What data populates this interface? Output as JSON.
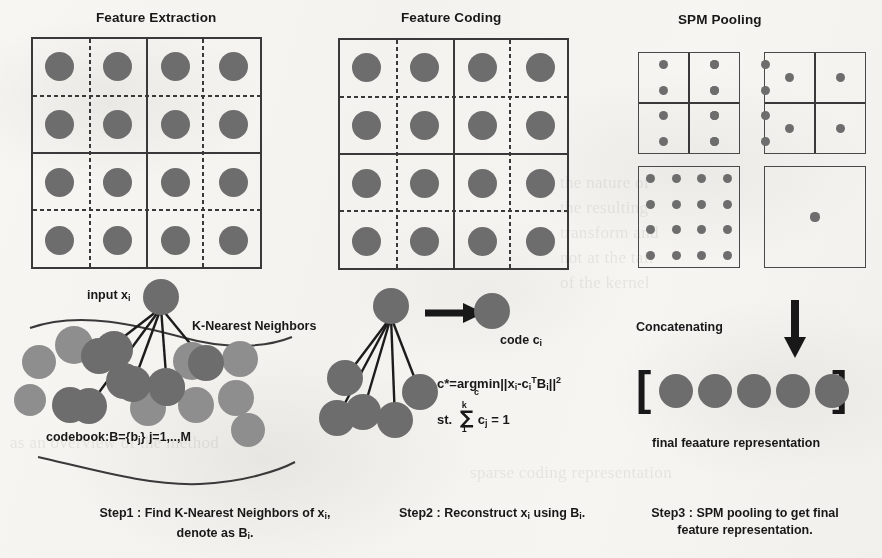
{
  "figure": {
    "background_color": "#f3f2ef",
    "ink_color": "#3a3a3a",
    "dot_color": "#6d6d6d",
    "dot_color_light": "#8e8e8e"
  },
  "panels": {
    "feature_extraction": {
      "title": "Feature Extraction",
      "grid": {
        "rows": 4,
        "cols": 4,
        "solid_divisions": 2,
        "dotted_divisions": 4,
        "dot_count": 16
      }
    },
    "feature_coding": {
      "title": "Feature Coding",
      "grid": {
        "rows": 4,
        "cols": 4,
        "solid_divisions": 2,
        "dotted_divisions": 4,
        "dot_count": 16
      }
    },
    "spm_pooling": {
      "title": "SPM Pooling",
      "levels": [
        {
          "name": "level-2-left",
          "cells": 4,
          "dots_per_cell": 4,
          "total_dots": 16
        },
        {
          "name": "level-2-right",
          "cells": 4,
          "dots_per_cell": 1,
          "total_dots": 4
        },
        {
          "name": "level-1-left",
          "cells": 1,
          "dots_per_cell": 16,
          "total_dots": 16
        },
        {
          "name": "level-1-right",
          "cells": 1,
          "dots_per_cell": 1,
          "total_dots": 1
        }
      ]
    }
  },
  "step1": {
    "input_label": "input x",
    "input_label_sub": "i",
    "knn_label": "K-Nearest Neighbors",
    "codebook_label": "codebook:B={b",
    "codebook_label_sub": "j",
    "codebook_label_tail": "} j=1,..,M",
    "caption_line1": "Step1 : Find K-Nearest Neighbors of x",
    "caption_line1_sub": "i",
    "caption_line1_tail": ",",
    "caption_line2": "denote as B",
    "caption_line2_sub": "i",
    "caption_line2_tail": ".",
    "neighbor_count": 5,
    "codebook_dot_count": 17
  },
  "step2": {
    "code_label": "code c",
    "code_label_sub": "i",
    "formula_objective": {
      "lhs": "c*=",
      "argmin": "argmin",
      "argmin_under": "c",
      "norm": "||x",
      "norm_sub1": "i",
      "minus": "-c",
      "norm_sub2": "i",
      "transpose": "T",
      "basis": "B",
      "basis_sub": "i",
      "close": "||",
      "power": "2"
    },
    "formula_constraint": {
      "prefix": "st.",
      "sum_top": "k",
      "sum_bot": "1",
      "term": "c",
      "term_sub": "j",
      "equals": "= 1"
    },
    "caption_line1": "Step2 : Reconstruct x",
    "caption_line1_sub": "i",
    "caption_line1_mid": " using B",
    "caption_line1_sub2": "i",
    "caption_line1_tail": ".",
    "neighbor_count": 5
  },
  "step3": {
    "concatenating_label": "Concatenating",
    "vector_open": "[",
    "vector_close": "]",
    "vector_dot_count": 5,
    "final_label": "final feaature representation",
    "caption_line1": "Step3 : SPM pooling to get final",
    "caption_line2": "feature representation."
  },
  "ghost_text": {
    "col1": "the nature of\nthe resulting\ntransform and\nnot at the tail of\nthe kernel",
    "col2": "sparse cod\nrepresentat\nmore accurat\nrecognition a",
    "col3": "as an overview\nof the method\nused in the\nclassification"
  }
}
